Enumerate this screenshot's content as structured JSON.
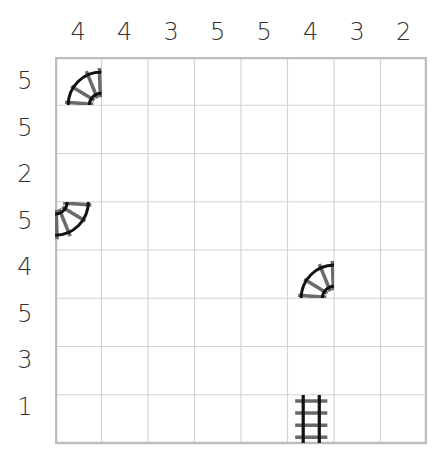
{
  "puzzle": {
    "type": "train-tracks",
    "rows": 8,
    "cols": 8,
    "column_clues": [
      "4",
      "4",
      "3",
      "5",
      "5",
      "4",
      "3",
      "2"
    ],
    "row_clues": [
      "5",
      "5",
      "2",
      "5",
      "4",
      "5",
      "3",
      "1"
    ],
    "given_pieces": [
      {
        "row": 0,
        "col": 0,
        "shape": "curve",
        "connects": [
          "bottom",
          "right"
        ],
        "icon": "curve-track-icon"
      },
      {
        "row": 3,
        "col": 0,
        "shape": "curve",
        "connects": [
          "left",
          "top"
        ],
        "icon": "curve-track-icon"
      },
      {
        "row": 4,
        "col": 5,
        "shape": "curve",
        "connects": [
          "bottom",
          "right"
        ],
        "icon": "curve-track-icon"
      },
      {
        "row": 7,
        "col": 5,
        "shape": "straight",
        "connects": [
          "top",
          "bottom"
        ],
        "icon": "straight-track-icon"
      }
    ]
  },
  "colors": {
    "grid_line": "#cfcfcf",
    "grid_border": "#bdbdbd",
    "rail": "#111111",
    "sleeper": "#6a6a6a",
    "clue_text": "#333333"
  }
}
